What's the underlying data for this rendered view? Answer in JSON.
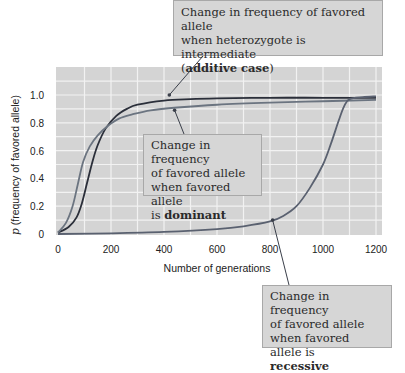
{
  "chart_data": {
    "type": "line",
    "title": "",
    "xlabel": "Number of generations",
    "ylabel": "p (frequency of favored allele)",
    "ylabel_italic_prefix": "p",
    "ylabel_rest": " (frequency of favored allele)",
    "xlim": [
      0,
      1200
    ],
    "ylim": [
      0,
      1.0
    ],
    "x_ticks": [
      0,
      200,
      400,
      600,
      800,
      1000,
      1200
    ],
    "x_tick_labels": [
      "0",
      "200",
      "400",
      "600",
      "800",
      "1000",
      "1200"
    ],
    "y_ticks": [
      0,
      0.2,
      0.4,
      0.6,
      0.8,
      1.0
    ],
    "y_tick_labels": [
      "0",
      "0.2",
      "0.4",
      "0.6",
      "0.8",
      "1.0"
    ],
    "grid": true,
    "plot_background": "#d4d4d4",
    "grid_color": "#f2f2f2",
    "series": [
      {
        "name": "additive",
        "color": "#2b2f3a",
        "x": [
          0,
          40,
          70,
          90,
          110,
          130,
          150,
          180,
          220,
          260,
          300,
          400,
          500,
          600,
          800,
          1000,
          1200
        ],
        "values": [
          0.01,
          0.05,
          0.12,
          0.22,
          0.37,
          0.52,
          0.64,
          0.76,
          0.85,
          0.9,
          0.93,
          0.96,
          0.97,
          0.975,
          0.98,
          0.98,
          0.98
        ]
      },
      {
        "name": "dominant",
        "color": "#6b7480",
        "x": [
          0,
          30,
          55,
          75,
          95,
          120,
          150,
          190,
          230,
          280,
          350,
          450,
          600,
          800,
          1000,
          1200
        ],
        "values": [
          0.01,
          0.08,
          0.2,
          0.36,
          0.52,
          0.63,
          0.71,
          0.78,
          0.83,
          0.86,
          0.89,
          0.91,
          0.93,
          0.945,
          0.955,
          0.965
        ]
      },
      {
        "name": "recessive",
        "color": "#5a6170",
        "x": [
          0,
          200,
          400,
          600,
          700,
          800,
          850,
          900,
          950,
          1000,
          1030,
          1060,
          1080,
          1100,
          1150,
          1200
        ],
        "values": [
          0.0,
          0.005,
          0.015,
          0.035,
          0.055,
          0.09,
          0.13,
          0.2,
          0.33,
          0.5,
          0.65,
          0.82,
          0.92,
          0.97,
          0.985,
          0.99
        ]
      }
    ],
    "annotations": [
      {
        "id": "additive",
        "lines": [
          "Change in frequency of favored allele",
          "when heterozygote is intermediate"
        ],
        "prefix": "(",
        "bold": "additive case",
        "suffix": ")",
        "points_to": {
          "x": 420,
          "y": 1.0
        }
      },
      {
        "id": "dominant",
        "lines": [
          "Change in frequency",
          "of favored allele",
          "when favored allele"
        ],
        "prefix": "is ",
        "bold": "dominant",
        "suffix": "",
        "points_to": {
          "x": 440,
          "y": 0.89
        }
      },
      {
        "id": "recessive",
        "lines": [
          "Change in frequency",
          "of favored allele",
          "when favored allele is"
        ],
        "prefix": "",
        "bold": "recessive",
        "suffix": "",
        "points_to": {
          "x": 810,
          "y": 0.1
        }
      }
    ]
  }
}
